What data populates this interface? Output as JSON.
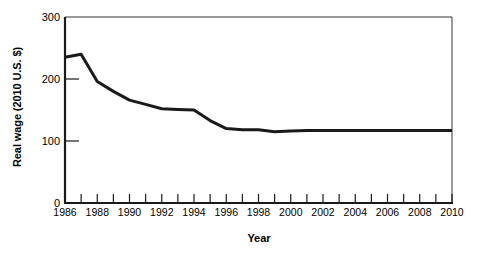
{
  "chart_data": {
    "type": "line",
    "title": "",
    "xlabel": "Year",
    "ylabel": "Real wage (2010 U.S. $)",
    "xlim": [
      1986,
      2010
    ],
    "ylim": [
      0,
      300
    ],
    "ytick_values": [
      0,
      100,
      200,
      300
    ],
    "ytick_labels": [
      "0",
      "100",
      "200",
      "300"
    ],
    "xtick_values": [
      1986,
      1988,
      1990,
      1992,
      1994,
      1996,
      1998,
      2000,
      2002,
      2004,
      2006,
      2008,
      2010
    ],
    "xtick_labels": [
      "1986",
      "1988",
      "1990",
      "1992",
      "1994",
      "1996",
      "1998",
      "2000",
      "2002",
      "2004",
      "2006",
      "2008",
      "2010"
    ],
    "xminor_interval": 1,
    "grid": false,
    "legend": false,
    "legend_position": "none",
    "line_color": "#1a1a1a",
    "line_width": 3,
    "axis_color": "#1a1a1a",
    "background_color": "#ffffff",
    "series": [
      {
        "name": "Real wage",
        "x": [
          1986,
          1987,
          1988,
          1989,
          1990,
          1991,
          1992,
          1993,
          1994,
          1995,
          1996,
          1997,
          1998,
          1999,
          2000,
          2001,
          2002,
          2003,
          2004,
          2005,
          2006,
          2007,
          2008,
          2009,
          2010
        ],
        "values": [
          235,
          240,
          196,
          180,
          166,
          159,
          152,
          151,
          150,
          133,
          120,
          118,
          118,
          115,
          116,
          117,
          117,
          117,
          117,
          117,
          117,
          117,
          117,
          117,
          117
        ]
      }
    ]
  },
  "axes": {
    "y_axis_label": "Real wage (2010 U.S. $)",
    "x_axis_label": "Year"
  }
}
